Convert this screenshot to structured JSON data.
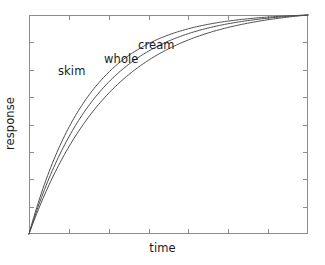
{
  "chart_data": {
    "type": "line",
    "title": "",
    "subtitle": "",
    "xlabel": "time",
    "ylabel": "response",
    "grid": false,
    "legend": "inline-curve-labels",
    "xlim": [
      0,
      1
    ],
    "ylim": [
      0,
      1
    ],
    "x_tick_labels": [],
    "y_tick_labels": [],
    "x_tick_count": 6,
    "y_tick_count": 7,
    "axis_color": "#8c8c8c",
    "curve_color": "#4d4d4d",
    "text_color": "#1a1a1a",
    "background": "#ffffff",
    "annotations": [
      {
        "text": "skim",
        "x": 0.2,
        "y": 0.74
      },
      {
        "text": "whole",
        "x": 0.36,
        "y": 0.8
      },
      {
        "text": "cream",
        "x": 0.48,
        "y": 0.86
      }
    ],
    "series": [
      {
        "name": "skim",
        "note": "fastest rise; uppermost saturating curve",
        "rate": 4.6,
        "x": [
          0,
          0.04,
          0.08,
          0.12,
          0.16,
          0.2,
          0.25,
          0.3,
          0.35,
          0.4,
          0.5,
          0.6,
          0.7,
          0.8,
          0.9,
          1.0
        ],
        "y": [
          0,
          0.175,
          0.326,
          0.454,
          0.565,
          0.659,
          0.755,
          0.826,
          0.879,
          0.918,
          0.963,
          0.983,
          0.992,
          0.997,
          0.999,
          1.0
        ]
      },
      {
        "name": "whole",
        "note": "intermediate rise; middle saturating curve",
        "rate": 4.0,
        "x": [
          0,
          0.04,
          0.08,
          0.12,
          0.16,
          0.2,
          0.25,
          0.3,
          0.35,
          0.4,
          0.5,
          0.6,
          0.7,
          0.8,
          0.9,
          1.0
        ],
        "y": [
          0,
          0.154,
          0.29,
          0.408,
          0.512,
          0.602,
          0.697,
          0.77,
          0.827,
          0.872,
          0.932,
          0.962,
          0.979,
          0.989,
          0.996,
          1.0
        ]
      },
      {
        "name": "cream",
        "note": "slowest rise; lowermost saturating curve",
        "rate": 3.4,
        "x": [
          0,
          0.04,
          0.08,
          0.12,
          0.16,
          0.2,
          0.25,
          0.3,
          0.35,
          0.4,
          0.5,
          0.6,
          0.7,
          0.8,
          0.9,
          1.0
        ],
        "y": [
          0,
          0.133,
          0.252,
          0.357,
          0.451,
          0.534,
          0.625,
          0.698,
          0.758,
          0.808,
          0.881,
          0.925,
          0.953,
          0.972,
          0.987,
          1.0
        ]
      }
    ]
  },
  "plot": {
    "frame": {
      "left": 29,
      "top": 15,
      "right": 308,
      "bottom": 234
    },
    "tick_length": 5
  },
  "labels": {
    "skim": "skim",
    "whole": "whole",
    "cream": "cream",
    "xaxis": "time",
    "yaxis": "response"
  }
}
